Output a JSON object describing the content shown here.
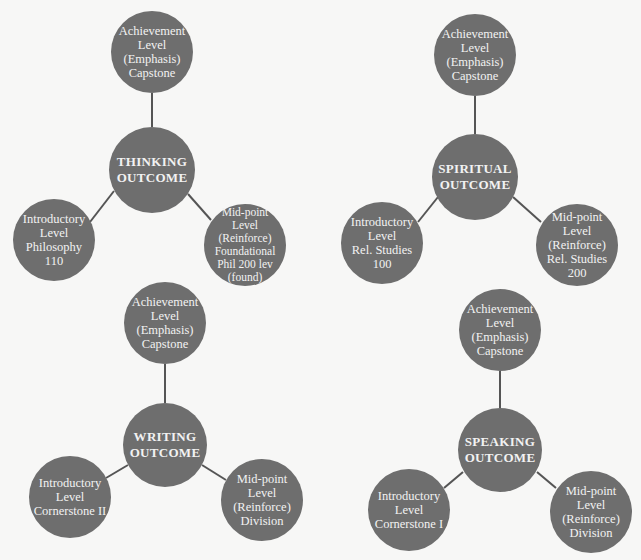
{
  "colors": {
    "node_fill": "#6e6e6e",
    "node_text": "#f2f2f2",
    "connector": "#555555",
    "background": "#f7f7f6"
  },
  "diagrams": [
    {
      "center": {
        "label": "THINKING\nOUTCOME",
        "x": 152,
        "y": 170,
        "r": 43
      },
      "top": {
        "label": "Achievement\nLevel\n(Emphasis)\nCapstone",
        "x": 152,
        "y": 52,
        "r": 41
      },
      "left": {
        "label": "Introductory\nLevel\nPhilosophy 110",
        "x": 54,
        "y": 240,
        "r": 41
      },
      "right": {
        "label": "Mid-point\nLevel\n(Reinforce)\nFoundational\nPhil 200 lev\n(found)",
        "x": 245,
        "y": 245,
        "r": 41
      }
    },
    {
      "center": {
        "label": "SPIRITUAL\nOUTCOME",
        "x": 475,
        "y": 177,
        "r": 43
      },
      "top": {
        "label": "Achievement\nLevel\n(Emphasis)\nCapstone",
        "x": 475,
        "y": 55,
        "r": 41
      },
      "left": {
        "label": "Introductory\nLevel\nRel. Studies 100",
        "x": 382,
        "y": 243,
        "r": 41
      },
      "right": {
        "label": "Mid-point\nLevel\n(Reinforce)\nRel. Studies 200",
        "x": 577,
        "y": 245,
        "r": 41
      }
    },
    {
      "center": {
        "label": "WRITING\nOUTCOME",
        "x": 165,
        "y": 445,
        "r": 42
      },
      "top": {
        "label": "Achievement\nLevel\n(Emphasis)\nCapstone",
        "x": 165,
        "y": 323,
        "r": 41
      },
      "left": {
        "label": "Introductory\nLevel\nCornerstone II",
        "x": 70,
        "y": 497,
        "r": 41
      },
      "right": {
        "label": "Mid-point\nLevel\n(Reinforce)\nDivision",
        "x": 262,
        "y": 500,
        "r": 41
      }
    },
    {
      "center": {
        "label": "SPEAKING\nOUTCOME",
        "x": 500,
        "y": 450,
        "r": 42
      },
      "top": {
        "label": "Achievement\nLevel\n(Emphasis)\nCapstone",
        "x": 500,
        "y": 330,
        "r": 41
      },
      "left": {
        "label": "Introductory\nLevel\nCornerstone I",
        "x": 409,
        "y": 510,
        "r": 41
      },
      "right": {
        "label": "Mid-point\nLevel\n(Reinforce)\nDivision",
        "x": 591,
        "y": 512,
        "r": 41
      }
    }
  ]
}
